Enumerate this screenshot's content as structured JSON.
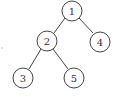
{
  "diagram": {
    "type": "binary-tree",
    "nodes": [
      {
        "id": "1",
        "label": "1",
        "cx": 72,
        "cy": 11
      },
      {
        "id": "2",
        "label": "2",
        "cx": 47,
        "cy": 41
      },
      {
        "id": "4",
        "label": "4",
        "cx": 100,
        "cy": 42
      },
      {
        "id": "3",
        "label": "3",
        "cx": 23,
        "cy": 78
      },
      {
        "id": "5",
        "label": "5",
        "cx": 74,
        "cy": 78
      }
    ],
    "edges": [
      {
        "from": "1",
        "to": "2"
      },
      {
        "from": "1",
        "to": "4"
      },
      {
        "from": "2",
        "to": "3"
      },
      {
        "from": "2",
        "to": "5"
      }
    ]
  }
}
